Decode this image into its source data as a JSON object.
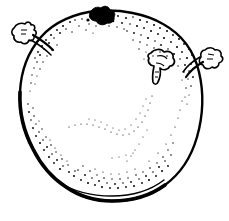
{
  "canvas": {
    "width": 229,
    "height": 221,
    "background_color": "#ffffff",
    "ink_color": "#000000",
    "style": "black-and-white pen-and-ink line drawing with stipple shading"
  },
  "subject": {
    "name": "round fruit",
    "title": "Line drawing of a round fruit with stem scar and three twig stubs",
    "description": "Hand-drawn botanical style illustration of a rounded, slightly irregular fruit seen from the side. A solid black stem scar sits at the top. Three small hollow twig stubs project from the upper-left edge, the right edge, and the upper-middle of the body surface. Stipple dots shade the upper-right rim and the lower-left and bottom interior edge, plus a faint V-shaped contour crease across the lower middle of the body."
  },
  "parts": [
    {
      "id": "body-outline",
      "label": "fruit body outline",
      "description": "Closed irregular oval contour, thick on the lower-left and bottom, thinner on the right"
    },
    {
      "id": "stem-scar",
      "label": "stem scar",
      "description": "Solid black irregular blob at the top of the fruit",
      "fill": "#000000"
    },
    {
      "id": "twig-stub-left",
      "label": "left twig stub",
      "description": "Small hollow outlined branch stub projecting from the upper-left edge"
    },
    {
      "id": "twig-stub-right",
      "label": "right twig stub",
      "description": "Small hollow outlined branch stub projecting from the right edge"
    },
    {
      "id": "twig-stub-surface",
      "label": "surface twig stub",
      "description": "Small hollow outlined branch stub on the upper-middle body surface"
    },
    {
      "id": "stipple-top-right",
      "label": "top-right stipple shading",
      "description": "Dense band of dots along the upper-right rim"
    },
    {
      "id": "stipple-left",
      "label": "left stipple shading",
      "description": "Medium band of dots along the upper-left and lower-left inner edge"
    },
    {
      "id": "stipple-bottom",
      "label": "bottom stipple shading",
      "description": "Dense band of dots along the bottom inner edge"
    },
    {
      "id": "contour-crease",
      "label": "interior contour crease",
      "description": "Faint V-shaped line of sparse dots across the lower middle of the body"
    }
  ]
}
